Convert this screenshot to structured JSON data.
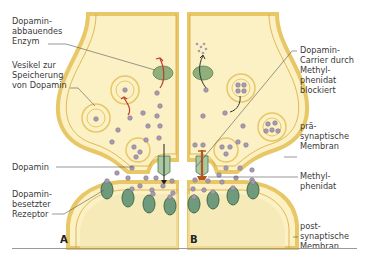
{
  "figure": {
    "panels": [
      {
        "id": "A",
        "label": "A"
      },
      {
        "id": "B",
        "label": "B"
      }
    ],
    "labels_left": {
      "enzyme": "Dopamin-\nabbauendes\nEnzym",
      "vesicle": "Vesikel zur\nSpeicherung\nvon Dopamin",
      "dopamine": "Dopamin",
      "receptor": "Dopamin-\nbesetzter\nRezeptor"
    },
    "labels_right": {
      "carrier": "Dopamin-\nCarrier durch\nMethyl-\nphenidat\nblockiert",
      "presynaptic": "prä-\nsynaptische\nMembran",
      "methylphenidate": "Methyl-\nphenidat",
      "postsynaptic": "post-\nsynaptische\nMembran"
    },
    "colors": {
      "cytoplasm": "#fbf1c4",
      "membrane": "#e8c766",
      "membrane_line": "#d9a93a",
      "cleft": "#ffffff",
      "post_inner": "#f5e6b2",
      "receptor": "#6f9a7c",
      "receptor_dark": "#3f6b4d",
      "dopamine": "#a79bb0",
      "dopamine_edge": "#7d6f86",
      "enzyme": "#8fb07a",
      "arrow_red": "#c0392b",
      "methylphenidate": "#b5541f",
      "leader": "#555555"
    }
  }
}
